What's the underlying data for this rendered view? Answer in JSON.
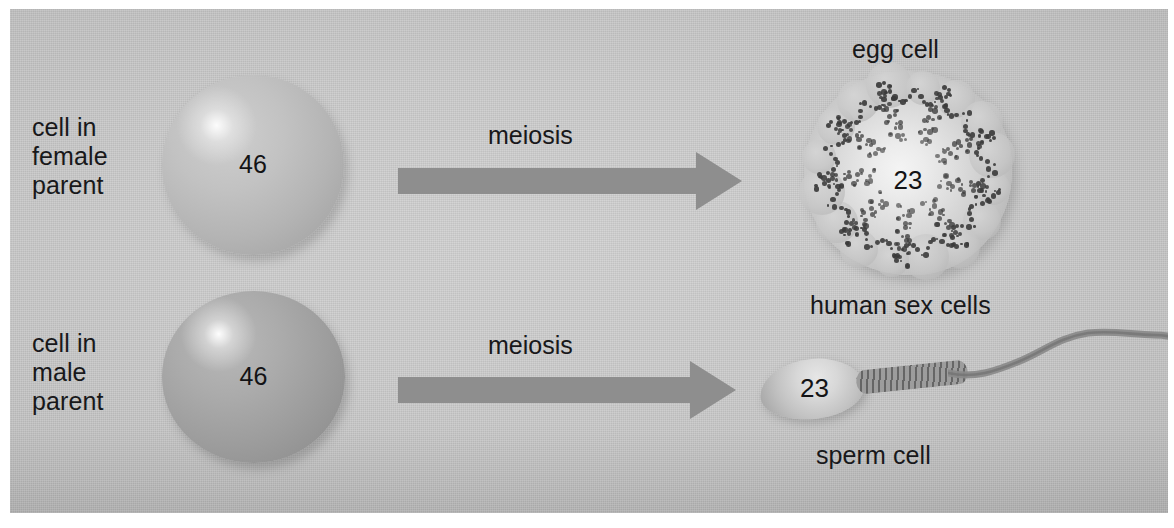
{
  "figure": {
    "background_color": "#c9c9c9",
    "ink_color": "#18181a",
    "arrow_color": "#8e8e8e"
  },
  "labels": {
    "female_parent": "cell in\nfemale\nparent",
    "male_parent": "cell in\nmale\nparent",
    "meiosis_top": "meiosis",
    "meiosis_bottom": "meiosis",
    "egg_cell": "egg cell",
    "human_sex_cells": "human sex cells",
    "sperm_cell": "sperm cell"
  },
  "chromosome_counts": {
    "female_parent_cell": "46",
    "male_parent_cell": "46",
    "egg_cell": "23",
    "sperm_cell": "23"
  },
  "cells": [
    {
      "name": "female-parent-cell",
      "shape": "sphere",
      "number": "46",
      "tone": "light-gray"
    },
    {
      "name": "male-parent-cell",
      "shape": "sphere",
      "number": "46",
      "tone": "medium-gray"
    },
    {
      "name": "egg-cell",
      "shape": "bumpy-sphere-with-granules",
      "number": "23",
      "tone": "pale-gray"
    },
    {
      "name": "sperm-cell",
      "shape": "oval-head-with-flagellum",
      "number": "23",
      "tone": "pale-gray"
    }
  ],
  "arrows": [
    {
      "name": "meiosis-arrow-female",
      "label": "meiosis",
      "direction": "right"
    },
    {
      "name": "meiosis-arrow-male",
      "label": "meiosis",
      "direction": "right"
    }
  ]
}
